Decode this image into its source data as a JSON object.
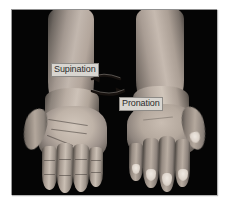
{
  "figure": {
    "background_color": "#ffffff",
    "photo": {
      "background_color": "#050505",
      "description": "Black-background photograph of two forearms and hands seen from the front; the left hand is turned palm-up and the right hand is turned palm-down."
    }
  },
  "annotations": {
    "supination": {
      "label": "Supination",
      "text_color": "#2b2b2b",
      "box_color": "#d8d5d0",
      "direction": "left",
      "description": "Curved arrow pointing left, indicating rotation of the forearm to bring the palm upward"
    },
    "pronation": {
      "label": "Pronation",
      "text_color": "#2b2b2b",
      "box_color": "#d8d5d0",
      "direction": "right",
      "description": "Curved arrow pointing right, indicating rotation of the forearm to bring the palm downward"
    }
  },
  "anatomy": {
    "left_hand": {
      "name": "left-hand",
      "position": "supinated",
      "visible_surface": "palm"
    },
    "right_hand": {
      "name": "right-hand",
      "position": "pronated",
      "visible_surface": "dorsum"
    }
  }
}
